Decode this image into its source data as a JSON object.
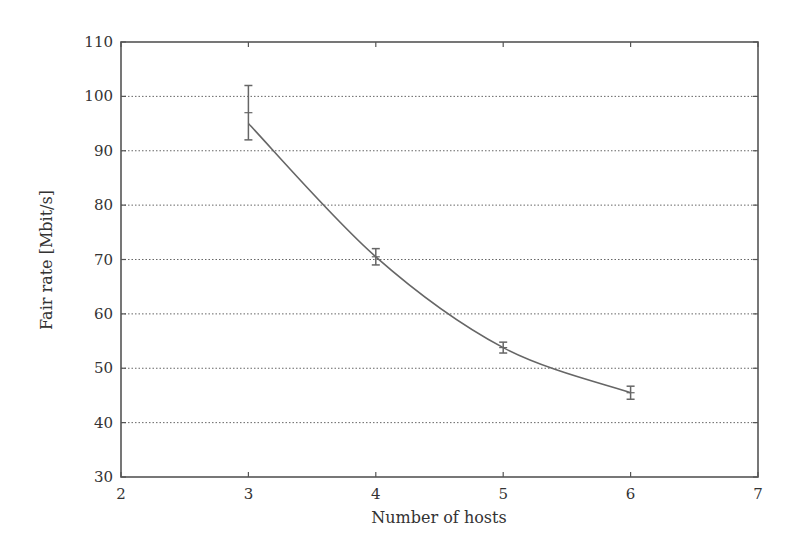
{
  "chart_data": {
    "type": "line",
    "title": "",
    "xlabel": "Number of hosts",
    "ylabel": "Fair rate [Mbit/s]",
    "xlim": [
      2,
      7
    ],
    "ylim": [
      30,
      110
    ],
    "xticks": [
      2,
      3,
      4,
      5,
      6,
      7
    ],
    "yticks": [
      30,
      40,
      50,
      60,
      70,
      80,
      90,
      100,
      110
    ],
    "grid": {
      "y": true,
      "x": false,
      "style": "dotted"
    },
    "legend": null,
    "series": [
      {
        "name": "Fair rate",
        "x": [
          3,
          4,
          5,
          6
        ],
        "values": [
          97,
          70.5,
          53.8,
          45.5
        ],
        "error": [
          5,
          1.5,
          1,
          1.2
        ],
        "fit_curve_start": 95,
        "color": "#666666"
      }
    ]
  }
}
